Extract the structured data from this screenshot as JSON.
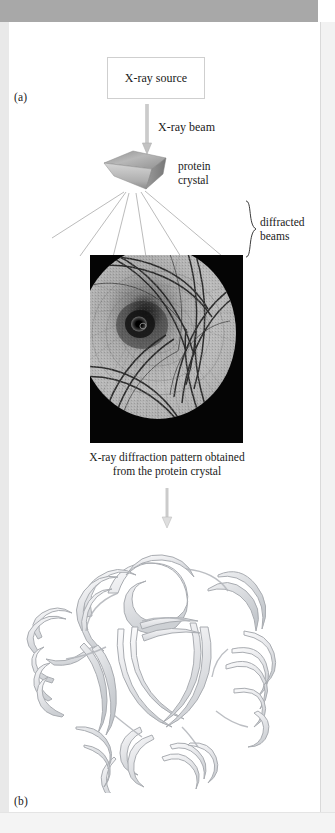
{
  "figure": {
    "panels": {
      "a_label": "(a)",
      "b_label": "(b)"
    },
    "source_box": {
      "label": "X-ray source"
    },
    "beam": {
      "label": "X-ray beam",
      "icon": "down-arrow-icon"
    },
    "crystal": {
      "label_line1": "protein",
      "label_line2": "crystal",
      "icon": "crystal-wedge-icon"
    },
    "diffracted": {
      "label_line1": "diffracted",
      "label_line2": "beams",
      "brace_icon": "curly-brace-icon",
      "ray_count": 6
    },
    "pattern": {
      "icon": "diffraction-pattern-image",
      "caption_line1": "X-ray diffraction pattern obtained",
      "caption_line2": "from the protein crystal",
      "background_color": "#050505",
      "disc_color": "#b9b9b9"
    },
    "transition": {
      "icon": "down-arrow-icon"
    },
    "structure": {
      "icon": "protein-ribbon-diagram",
      "ribbon_color": "#e8e9eb",
      "outline_color": "#a9acb1"
    }
  },
  "colors": {
    "page_background": "#ffffff",
    "top_band": "#a8a8a8",
    "text": "#1a1a1a",
    "rule": "#cfcfcf",
    "arrow_gray": "#b0b0b0"
  }
}
